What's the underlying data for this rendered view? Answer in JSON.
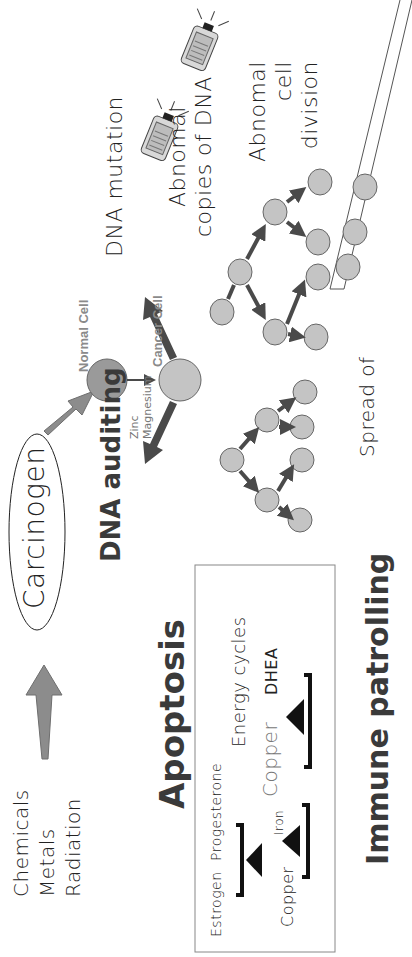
{
  "diagram": {
    "orientation": "rotated 90 degrees counter-clockwise",
    "sources": {
      "items": [
        "Chemicals",
        "Metals",
        "Radiation"
      ]
    },
    "carcinogen": {
      "label": "Carcinogen"
    },
    "dna_auditing": {
      "title": "DNA auditing",
      "nutrients": [
        "Zinc",
        "Magnesium"
      ]
    },
    "cells": {
      "normal_label": "Normal Cell",
      "cancer_label": "Cancer Cell"
    },
    "stages": {
      "dna_mutation": "DNA mutation",
      "abnormal_copies_line1": "Abnomal",
      "abnormal_copies_line2": "copies of DNA",
      "abnormal_division_line1": "Abnomal",
      "abnormal_division_line2": "cell",
      "abnormal_division_line3": "division",
      "spread": "Spread of"
    },
    "apoptosis": {
      "title": "Apoptosis",
      "balances": [
        {
          "left": "Estrogen",
          "right": "Progesterone"
        },
        {
          "left": "Copper",
          "right": "Iron"
        },
        {
          "left": "Copper",
          "right": "DHEA",
          "caption": "Energy cycles"
        }
      ]
    },
    "immune": {
      "title": "Immune patrolling"
    },
    "colors": {
      "normal_cell": "#9a9a9a",
      "cancer_cell": "#c4c4c4",
      "arrow_dark": "#4a4a4a",
      "arrow_grey": "#8c8c8c",
      "heading": "#3a3a3a"
    }
  }
}
